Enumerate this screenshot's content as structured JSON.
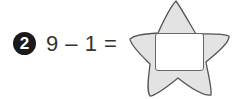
{
  "problem": {
    "number": "2",
    "expression": "9 – 1 =",
    "answer_value": ""
  },
  "shape": {
    "name": "star",
    "fill": "#e3e3e3",
    "stroke": "#555555"
  }
}
